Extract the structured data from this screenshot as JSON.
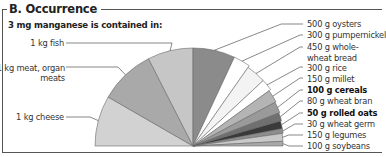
{
  "header": {
    "title": "B. Occurrence",
    "subtitle": "3 mg manganese is contained in:"
  },
  "left_labels": [
    {
      "line1": "1 kg fish",
      "line2": ""
    },
    {
      "line1": "1 kg meat, organ",
      "line2": "meats"
    },
    {
      "line1": "1 kg cheese",
      "line2": ""
    }
  ],
  "right_labels": [
    {
      "line1": "500 g oysters",
      "line2": ""
    },
    {
      "line1": "300 g pumpernickel",
      "line2": ""
    },
    {
      "line1": "450 g whole-",
      "line2": "wheat bread"
    },
    {
      "line1": "300 g rice",
      "line2": ""
    },
    {
      "line1": "150 g millet",
      "line2": ""
    },
    {
      "line1": "100 g cereals",
      "line2": ""
    },
    {
      "line1": "80 g wheat bran",
      "line2": ""
    },
    {
      "line1": "50 g rolled oats",
      "line2": ""
    },
    {
      "line1": "30 g wheat germ",
      "line2": ""
    },
    {
      "line1": "150 g legumes",
      "line2": ""
    },
    {
      "line1": "100 g soybeans",
      "line2": ""
    }
  ],
  "chart_data": {
    "type": "pie",
    "title": "B. Occurrence",
    "subtitle": "3 mg manganese is contained in:",
    "note": "Semicircular fan; slice angular widths are approximate visual readings (degrees of a 180° fan)",
    "categories": [
      "1 kg cheese",
      "1 kg meat, organ meats",
      "1 kg fish",
      "500 g oysters",
      "300 g pumpernickel",
      "450 g whole-wheat bread",
      "300 g rice",
      "150 g millet",
      "100 g cereals",
      "80 g wheat bran",
      "50 g rolled oats",
      "30 g wheat germ",
      "150 g legumes",
      "100 g soybeans"
    ],
    "values": [
      30,
      33,
      27,
      25,
      10,
      12,
      7,
      8,
      7,
      5,
      5,
      3,
      5,
      3
    ],
    "bold_categories": [
      "100 g cereals",
      "50 g rolled oats"
    ],
    "colors": [
      "#d2d2d2",
      "#a9a9a9",
      "#c6c6c6",
      "#8b8b8b",
      "#ffffff",
      "#f3f3f3",
      "#ffffff",
      "#b4b4b4",
      "#9a9a9a",
      "#707070",
      "#3a3a3a",
      "#8e8e8e",
      "#c9c9c9",
      "#a8a8a8"
    ],
    "radii": [
      98,
      98,
      98,
      98,
      98,
      96,
      96,
      94,
      93,
      92,
      91,
      91,
      90,
      90
    ]
  }
}
